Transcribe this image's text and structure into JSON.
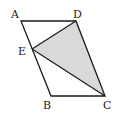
{
  "diagram": {
    "type": "geometry",
    "shape": "parallelogram ABCD with shaded triangle EDC",
    "points": {
      "A": {
        "label": "A",
        "x": 21,
        "y": 21
      },
      "D": {
        "label": "D",
        "x": 76,
        "y": 21
      },
      "E": {
        "label": "E",
        "x": 32,
        "y": 49
      },
      "B": {
        "label": "B",
        "x": 51,
        "y": 96
      },
      "C": {
        "label": "C",
        "x": 105,
        "y": 96
      }
    },
    "shaded_region": [
      "E",
      "D",
      "C"
    ],
    "colors": {
      "stroke": "#1a1a1a",
      "fill": "#d9d9d9"
    }
  }
}
